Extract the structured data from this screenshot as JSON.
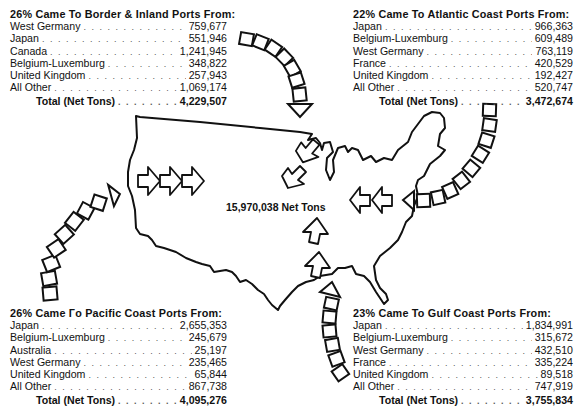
{
  "center_total": "15,970,038 Net Tons",
  "panels": {
    "border": {
      "title": "26% Came To Border & Inland Ports From:",
      "rows": [
        {
          "name": "West Germany",
          "value": "759,677"
        },
        {
          "name": "Japan",
          "value": "551,946"
        },
        {
          "name": "Canada",
          "value": "1,241,945"
        },
        {
          "name": "Belgium-Luxemburg",
          "value": "348,822"
        },
        {
          "name": "United Kingdom",
          "value": "257,943"
        },
        {
          "name": "All Other",
          "value": "1,069,174"
        }
      ],
      "total_label": "Total (Net Tons)",
      "total_value": "4,229,507"
    },
    "atlantic": {
      "title": "22% Came To Atlantic Coast Ports From:",
      "rows": [
        {
          "name": "Japan",
          "value": "966,363"
        },
        {
          "name": "Belgium-Luxemburg",
          "value": "609,489"
        },
        {
          "name": "West Germany",
          "value": "763,119"
        },
        {
          "name": "France",
          "value": "420,529"
        },
        {
          "name": "United Kingdom",
          "value": "192,427"
        },
        {
          "name": "All Other",
          "value": "520,747"
        }
      ],
      "total_label": "Total (Net Tons)",
      "total_value": "3,472,674"
    },
    "pacific": {
      "title": "26% Came Гo Pacific Coast Ports From:",
      "rows": [
        {
          "name": "Japan",
          "value": "2,655,353"
        },
        {
          "name": "Belgium-Luxemburg",
          "value": "245,679"
        },
        {
          "name": "Australia",
          "value": "25,197"
        },
        {
          "name": "West Germany",
          "value": "235,465"
        },
        {
          "name": "United Kingdom",
          "value": "65,844"
        },
        {
          "name": "All Other",
          "value": "867,738"
        }
      ],
      "total_label": "Total (Net Tons)",
      "total_value": "4,095,276"
    },
    "gulf": {
      "title": "23% Came To Gulf Coast Ports From:",
      "rows": [
        {
          "name": "Japan",
          "value": "1,834,991"
        },
        {
          "name": "Belgium-Luxemburg",
          "value": "315,672"
        },
        {
          "name": "West Germany",
          "value": "432,510"
        },
        {
          "name": "France",
          "value": "335,224"
        },
        {
          "name": "United Kingdom",
          "value": "89,518"
        },
        {
          "name": "All Other",
          "value": "747,919"
        }
      ],
      "total_label": "Total (Net Tons)",
      "total_value": "3,755,834"
    }
  },
  "colors": {
    "ink": "#111111",
    "background": "#ffffff"
  }
}
